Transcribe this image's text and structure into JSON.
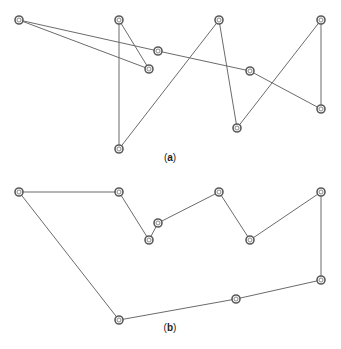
{
  "diagram": {
    "panels": [
      {
        "id": "a",
        "caption_open": "(",
        "caption_letter": "a",
        "caption_close": ")",
        "caption_pos": [
          170,
          158
        ],
        "nodes": [
          [
            19,
            20
          ],
          [
            119,
            20
          ],
          [
            149,
            69
          ],
          [
            158,
            51
          ],
          [
            219,
            20
          ],
          [
            250,
            71
          ],
          [
            321,
            20
          ],
          [
            321,
            109
          ],
          [
            237,
            128
          ],
          [
            119,
            149
          ]
        ],
        "edges": [
          [
            0,
            3
          ],
          [
            3,
            5
          ],
          [
            5,
            7
          ],
          [
            0,
            2
          ],
          [
            2,
            1
          ],
          [
            1,
            9
          ],
          [
            9,
            4
          ],
          [
            4,
            8
          ],
          [
            8,
            6
          ],
          [
            6,
            7
          ]
        ]
      },
      {
        "id": "b",
        "caption_open": "(",
        "caption_letter": "b",
        "caption_close": ")",
        "caption_pos": [
          170,
          328
        ],
        "nodes": [
          [
            19,
            192
          ],
          [
            119,
            192
          ],
          [
            149,
            240
          ],
          [
            158,
            223
          ],
          [
            219,
            192
          ],
          [
            250,
            240
          ],
          [
            321,
            192
          ],
          [
            321,
            280
          ],
          [
            236,
            299
          ],
          [
            119,
            320
          ]
        ],
        "edges": [
          [
            0,
            1
          ],
          [
            1,
            2
          ],
          [
            2,
            3
          ],
          [
            3,
            4
          ],
          [
            4,
            5
          ],
          [
            5,
            6
          ],
          [
            6,
            7
          ],
          [
            7,
            8
          ],
          [
            8,
            9
          ],
          [
            9,
            0
          ]
        ]
      }
    ],
    "colors": {
      "edge": "#6b6b6b",
      "node_stroke": "#5a5a5a",
      "background": "#ffffff"
    }
  }
}
